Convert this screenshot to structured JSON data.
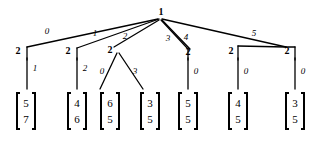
{
  "diagram": {
    "root": {
      "label": "1",
      "x": 160,
      "y": 13
    },
    "internal_nodes": [
      {
        "label": "2",
        "x": 18,
        "y": 51
      },
      {
        "label": "2",
        "x": 68,
        "y": 51
      },
      {
        "label": "2",
        "x": 110,
        "y": 50
      },
      {
        "label": "2",
        "x": 188,
        "y": 52
      },
      {
        "label": "2",
        "x": 231,
        "y": 51
      },
      {
        "label": "2",
        "x": 287,
        "y": 51
      }
    ],
    "root_edge_labels": [
      {
        "text": "0",
        "x": 47,
        "y": 32
      },
      {
        "text": "1",
        "x": 95,
        "y": 34
      },
      {
        "text": "2",
        "x": 125,
        "y": 37
      },
      {
        "text": "3",
        "x": 168,
        "y": 39
      },
      {
        "text": "4",
        "x": 186,
        "y": 38
      },
      {
        "text": "5",
        "x": 254,
        "y": 34
      }
    ],
    "leaf_edge_labels": [
      {
        "text": "1",
        "x": 30,
        "y": 70
      },
      {
        "text": "2",
        "x": 80,
        "y": 70
      },
      {
        "text": "0",
        "x": 100,
        "y": 73
      },
      {
        "text": "3",
        "x": 133,
        "y": 73
      },
      {
        "text": "0",
        "x": 196,
        "y": 73
      },
      {
        "text": "0",
        "x": 243,
        "y": 73
      },
      {
        "text": "0",
        "x": 295,
        "y": 73
      }
    ],
    "leaves": [
      {
        "x": 26,
        "values": [
          "5",
          "7"
        ]
      },
      {
        "x": 77,
        "values": [
          "4",
          "6"
        ]
      },
      {
        "x": 110,
        "values": [
          "6",
          "5"
        ]
      },
      {
        "x": 150,
        "values": [
          "3",
          "5"
        ]
      },
      {
        "x": 188,
        "values": [
          "5",
          "5"
        ]
      },
      {
        "x": 236,
        "values": [
          "4",
          "5"
        ]
      },
      {
        "x": 287,
        "values": [
          "3",
          "5"
        ]
      }
    ],
    "colors": {
      "stroke": "#000000",
      "background": "#ffffff",
      "text": "#000000"
    },
    "geometry": {
      "leaf_top": 92,
      "leaf_bottom": 130,
      "leaf_half_width": 14
    }
  }
}
